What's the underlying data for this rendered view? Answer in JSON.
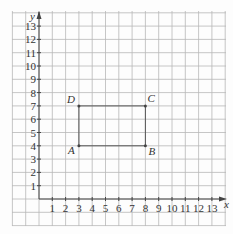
{
  "diagram": {
    "type": "coordinate-grid",
    "x_axis_label": "x",
    "y_axis_label": "y",
    "x_ticks": [
      "1",
      "2",
      "3",
      "4",
      "5",
      "6",
      "7",
      "8",
      "9",
      "10",
      "11",
      "12",
      "13"
    ],
    "y_ticks": [
      "1",
      "2",
      "3",
      "4",
      "5",
      "6",
      "7",
      "8",
      "9",
      "10",
      "11",
      "12",
      "13"
    ],
    "points": [
      {
        "name": "A",
        "x": 3,
        "y": 4
      },
      {
        "name": "B",
        "x": 8,
        "y": 4
      },
      {
        "name": "C",
        "x": 8,
        "y": 7
      },
      {
        "name": "D",
        "x": 3,
        "y": 7
      }
    ],
    "shape": "rectangle ABCD",
    "line_color": "#555555",
    "grid_color": "#b8b8b8"
  }
}
